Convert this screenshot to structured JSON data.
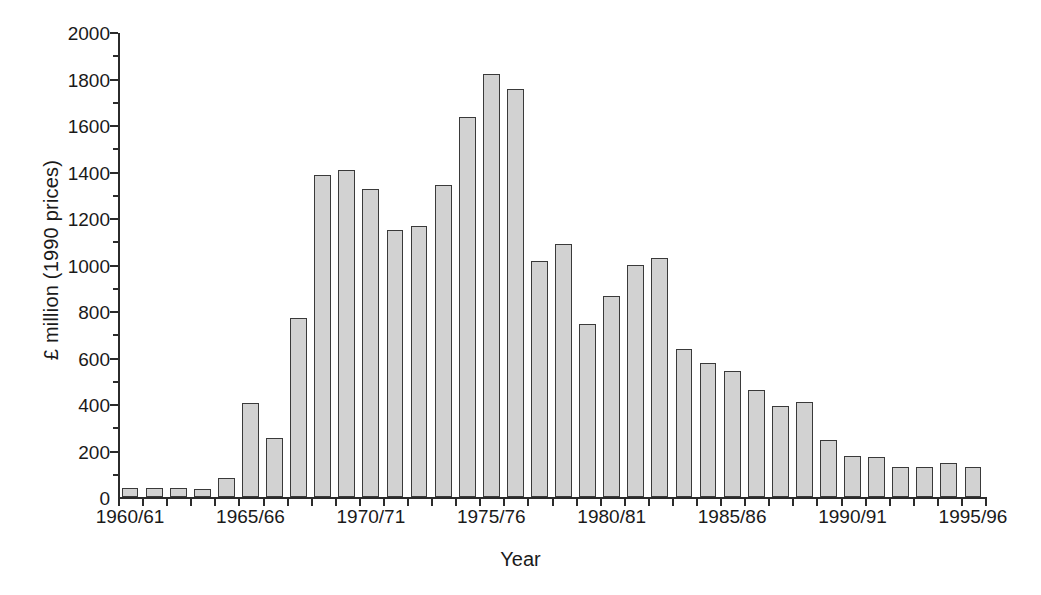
{
  "chart_data": {
    "type": "bar",
    "title": "",
    "xlabel": "Year",
    "ylabel": "£ million (1990 prices)",
    "ylim": [
      0,
      2000
    ],
    "y_major_ticks": [
      0,
      200,
      400,
      600,
      800,
      1000,
      1200,
      1400,
      1600,
      1800,
      2000
    ],
    "y_minor_ticks": [
      100,
      300,
      500,
      700,
      900,
      1100,
      1300,
      1500,
      1700,
      1900
    ],
    "y_tick_labels": [
      "0",
      "200",
      "400",
      "600",
      "800",
      "1000",
      "1200",
      "1400",
      "1600",
      "1800",
      "2000"
    ],
    "grid": false,
    "legend": false,
    "legend_position": "none",
    "bar_fill_color": "#d2d2d2",
    "bar_edge_color": "#3a3a3a",
    "axis_color": "#2b2b2b",
    "background_color": "#ffffff",
    "categories": [
      "1960/61",
      "1961/62",
      "1962/63",
      "1963/64",
      "1964/65",
      "1965/66",
      "1966/67",
      "1967/68",
      "1968/69",
      "1969/70",
      "1970/71",
      "1971/72",
      "1972/73",
      "1973/74",
      "1974/75",
      "1975/76",
      "1976/77",
      "1977/78",
      "1978/79",
      "1979/80",
      "1980/81",
      "1981/82",
      "1982/83",
      "1983/84",
      "1984/85",
      "1985/86",
      "1986/87",
      "1987/88",
      "1988/89",
      "1989/90",
      "1990/91",
      "1991/92",
      "1992/93",
      "1993/94",
      "1994/95",
      "1995/96"
    ],
    "values": [
      40,
      40,
      38,
      35,
      80,
      405,
      255,
      770,
      1385,
      1405,
      1325,
      1150,
      1165,
      1340,
      1635,
      1820,
      1755,
      1015,
      1090,
      745,
      865,
      1000,
      1030,
      635,
      575,
      540,
      460,
      390,
      410,
      245,
      175,
      172,
      128,
      130,
      145,
      130
    ],
    "labeled_ticks": [
      {
        "category": "1960/61",
        "label": "1960/61",
        "index": 0
      },
      {
        "category": "1965/66",
        "label": "1965/66",
        "index": 5
      },
      {
        "category": "1970/71",
        "label": "1970/71",
        "index": 10
      },
      {
        "category": "1975/76",
        "label": "1975/76",
        "index": 15
      },
      {
        "category": "1980/81",
        "label": "1980/81",
        "index": 20
      },
      {
        "category": "1985/86",
        "label": "1985/86",
        "index": 25
      },
      {
        "category": "1990/91",
        "label": "1990/91",
        "index": 30
      },
      {
        "category": "1995/96",
        "label": "1995/96",
        "index": 35
      }
    ]
  }
}
